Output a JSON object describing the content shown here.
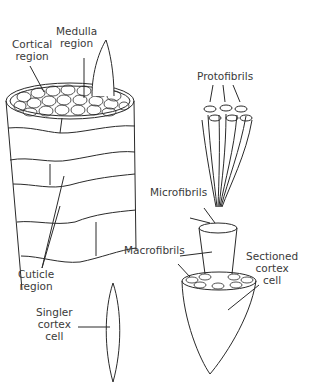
{
  "diagram": {
    "colors": {
      "line": "#2a2a2a",
      "text": "#3a3a3a",
      "background": "#ffffff"
    },
    "labels": {
      "cortical_region": [
        "Cortical",
        "region"
      ],
      "medulla_region": [
        "Medulla",
        "region"
      ],
      "cuticle_region": [
        "Cuticle",
        "region"
      ],
      "single_cortex_cell": [
        "Singler",
        "cortex",
        "cell"
      ],
      "protofibrils": [
        "Protofibrils"
      ],
      "microfibrils": [
        "Microfibrils"
      ],
      "macrofibrils": [
        "Macrofibrils"
      ],
      "sectioned_cortex_cell": [
        "Sectioned",
        "cortex",
        "cell"
      ]
    }
  }
}
